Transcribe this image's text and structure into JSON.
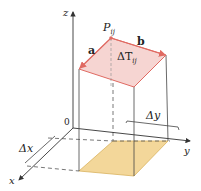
{
  "diagram": {
    "labels": {
      "z_axis": "z",
      "x_axis": "x",
      "y_axis": "y",
      "origin": "0",
      "point": "P",
      "point_sub": "ij",
      "vector_a": "a",
      "vector_b": "b",
      "patch": "ΔT",
      "patch_sub": "ij",
      "delta_x": "Δx",
      "delta_y": "Δy"
    },
    "colors": {
      "patch_fill": "#f6d5d2",
      "patch_edge": "#e06a62",
      "base_fill": "#f3d79a",
      "axis": "#333333",
      "guide": "#555555"
    }
  }
}
